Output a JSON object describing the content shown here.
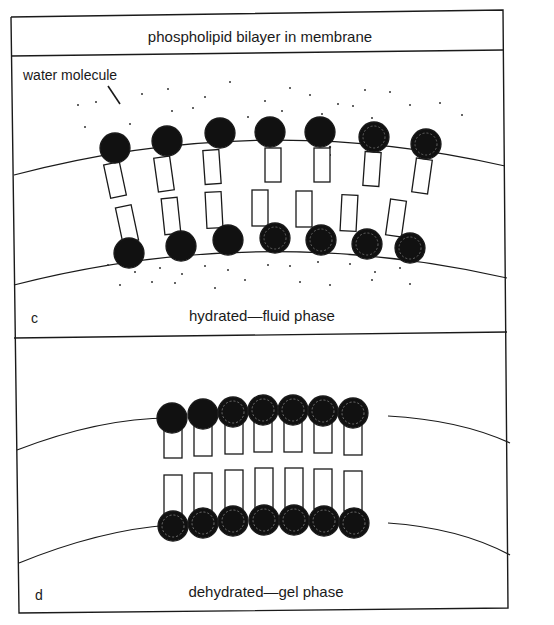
{
  "title": "phospholipid bilayer in membrane",
  "panel_c": {
    "letter": "c",
    "caption": "hydrated—fluid phase",
    "annotation": "water molecule",
    "molecules_per_leaflet": 7
  },
  "panel_d": {
    "letter": "d",
    "caption": "dehydrated—gel phase",
    "molecules_per_leaflet": 7
  },
  "colors": {
    "ink": "#1a1a1a",
    "background": "#ffffff"
  }
}
